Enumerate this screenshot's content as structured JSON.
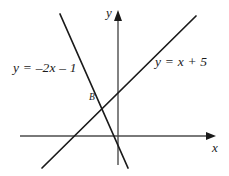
{
  "figure": {
    "type": "coordinate-plane-diagram",
    "width": 229,
    "height": 176,
    "background_color": "#ffffff",
    "stroke_color": "#1a1a1a",
    "axis_color": "#4d4d4d"
  },
  "axes": {
    "x_label": "x",
    "y_label": "y",
    "x_axis": {
      "x1": 20,
      "y1": 136,
      "x2": 216,
      "y2": 136,
      "arrow": "right"
    },
    "y_axis": {
      "x1": 118,
      "y1": 11,
      "x2": 118,
      "y2": 165,
      "arrow": "up"
    },
    "origin": {
      "x": 118,
      "y": 136
    }
  },
  "labels": {
    "line_falling": "y = –2x – 1",
    "line_rising": "y = x + 5",
    "point_b": "B"
  },
  "chart_data": {
    "type": "line",
    "title": "",
    "xlabel": "x",
    "ylabel": "y",
    "grid": false,
    "legend": "inline-annotations",
    "series": [
      {
        "name": "y = –2x – 1",
        "equation": "y = -2x - 1",
        "slope": -2,
        "intercept": -1,
        "label_text": "y = –2x – 1",
        "pixel_endpoints": [
          {
            "x": 60,
            "y": 14
          },
          {
            "x": 128,
            "y": 168
          }
        ]
      },
      {
        "name": "y = x + 5",
        "equation": "y = x + 5",
        "slope": 1,
        "intercept": 5,
        "label_text": "y = x + 5",
        "pixel_endpoints": [
          {
            "x": 42,
            "y": 168
          },
          {
            "x": 196,
            "y": 16
          }
        ]
      }
    ],
    "annotations": [
      {
        "label": "B",
        "description": "intersection point of the two lines",
        "pixel": {
          "x": 104,
          "y": 101
        }
      }
    ]
  }
}
